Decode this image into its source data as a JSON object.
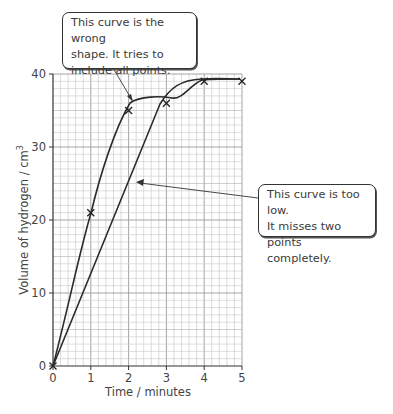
{
  "chart_data": {
    "type": "line",
    "title": "",
    "xlabel": "Time / minutes",
    "ylabel": "Volume of hydrogen / cm³",
    "xlim": [
      0,
      5
    ],
    "ylim": [
      0,
      40
    ],
    "x_ticks": [
      "0",
      "1",
      "2",
      "3",
      "4",
      "5"
    ],
    "y_ticks": [
      "0",
      "10",
      "20",
      "30",
      "40"
    ],
    "grid": true,
    "legend": null,
    "points": {
      "name": "Measured points (×)",
      "x": [
        0,
        1,
        2,
        3,
        4,
        5
      ],
      "y": [
        0,
        21,
        35,
        36,
        39,
        39
      ]
    },
    "series": [
      {
        "name": "Wrong shape curve (tries to include all points)",
        "x": [
          0,
          1,
          2,
          2.5,
          3,
          3.5,
          4,
          5
        ],
        "y": [
          0,
          21,
          35.5,
          36.5,
          36.8,
          37.8,
          39,
          39.2
        ]
      },
      {
        "name": "Too low curve (misses two points)",
        "x": [
          0,
          1,
          2,
          3,
          3.5,
          4,
          5
        ],
        "y": [
          0,
          12.5,
          25,
          36.5,
          38.6,
          39.2,
          39.3
        ]
      }
    ],
    "annotations": [
      {
        "text": "This curve is the wrong shape. It tries to include all points.",
        "points_to": [
          2.1,
          36
        ]
      },
      {
        "text": "This curve is too low. It misses two points completely.",
        "points_to": [
          2.2,
          25
        ]
      }
    ]
  },
  "callouts": {
    "top": {
      "line1": "This curve is the wrong",
      "line2": "shape. It tries to",
      "line3": "include all points."
    },
    "right": {
      "line1": "This curve is too low.",
      "line2": "It misses two points",
      "line3": "completely."
    }
  },
  "axes": {
    "x_title": "Time / minutes",
    "y_title": "Volume of hydrogen / cm",
    "y_title_sup": "3",
    "x_ticks": [
      "0",
      "1",
      "2",
      "3",
      "4",
      "5"
    ],
    "y_ticks": [
      "0",
      "10",
      "20",
      "30",
      "40"
    ]
  }
}
